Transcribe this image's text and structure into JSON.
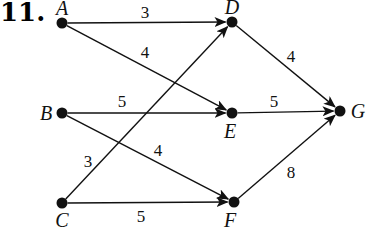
{
  "problem_number": "11.",
  "colors": {
    "ink": "#111111",
    "background": "#ffffff"
  },
  "nodes": [
    {
      "id": "A",
      "label": "A",
      "x": 62,
      "y": 23,
      "label_dx": 0,
      "label_dy": -8
    },
    {
      "id": "B",
      "label": "B",
      "x": 62,
      "y": 113,
      "label_dx": -16,
      "label_dy": 7
    },
    {
      "id": "C",
      "label": "C",
      "x": 62,
      "y": 203,
      "label_dx": 0,
      "label_dy": 24
    },
    {
      "id": "D",
      "label": "D",
      "x": 232,
      "y": 22,
      "label_dx": 0,
      "label_dy": -8
    },
    {
      "id": "E",
      "label": "E",
      "x": 232,
      "y": 113,
      "label_dx": -2,
      "label_dy": 25
    },
    {
      "id": "F",
      "label": "F",
      "x": 234,
      "y": 202,
      "label_dx": -4,
      "label_dy": 25
    },
    {
      "id": "G",
      "label": "G",
      "x": 340,
      "y": 111,
      "label_dx": 18,
      "label_dy": 7
    }
  ],
  "edges": [
    {
      "from": "A",
      "to": "D",
      "weight": "3",
      "label_x": 145,
      "label_y": 18
    },
    {
      "from": "A",
      "to": "E",
      "weight": "4",
      "label_x": 145,
      "label_y": 58
    },
    {
      "from": "B",
      "to": "E",
      "weight": "5",
      "label_x": 122,
      "label_y": 107
    },
    {
      "from": "B",
      "to": "F",
      "weight": "4",
      "label_x": 158,
      "label_y": 156
    },
    {
      "from": "C",
      "to": "D",
      "weight": "3",
      "label_x": 88,
      "label_y": 167
    },
    {
      "from": "C",
      "to": "F",
      "weight": "5",
      "label_x": 141,
      "label_y": 222
    },
    {
      "from": "D",
      "to": "G",
      "weight": "4",
      "label_x": 291,
      "label_y": 62
    },
    {
      "from": "E",
      "to": "G",
      "weight": "5",
      "label_x": 274,
      "label_y": 107
    },
    {
      "from": "F",
      "to": "G",
      "weight": "8",
      "label_x": 291,
      "label_y": 178
    }
  ]
}
